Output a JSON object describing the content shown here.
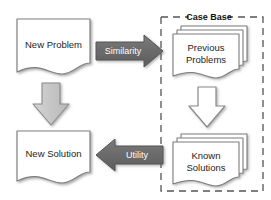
{
  "diagram": {
    "background_color": "#ffffff"
  },
  "nodes": {
    "new_problem": {
      "label": "New Problem",
      "shape": "document",
      "fill": "#ffffff",
      "stroke": "#808080"
    },
    "new_solution": {
      "label": "New Solution",
      "shape": "document",
      "fill": "#ffffff",
      "stroke": "#808080"
    },
    "previous_problems": {
      "label_line1": "Previous",
      "label_line2": "Problems",
      "shape": "document-stack",
      "fill": "#ffffff",
      "stroke": "#7d7d7d"
    },
    "known_solutions": {
      "label_line1": "Known",
      "label_line2": "Solutions",
      "shape": "document-stack",
      "fill": "#ffffff",
      "stroke": "#7d7d7d"
    }
  },
  "arrows": {
    "similarity": {
      "label": "Similarity",
      "direction": "right",
      "fill": "#6e6e6e",
      "stroke": "#555555",
      "text_color": "#ffffff"
    },
    "utility": {
      "label": "Utility",
      "direction": "left",
      "fill": "#6e6e6e",
      "stroke": "#555555",
      "text_color": "#ffffff"
    },
    "retain": {
      "label": "",
      "direction": "down",
      "fill": "#c9c9c9",
      "stroke": "#8a8a8a",
      "text_color": ""
    },
    "retrieve": {
      "label": "",
      "direction": "down",
      "fill": "#ffffff",
      "stroke": "#8a8a8a",
      "text_color": ""
    }
  },
  "groups": {
    "case_base": {
      "label": "Case Base",
      "border_style": "dashed",
      "border_color": "#555555"
    }
  }
}
